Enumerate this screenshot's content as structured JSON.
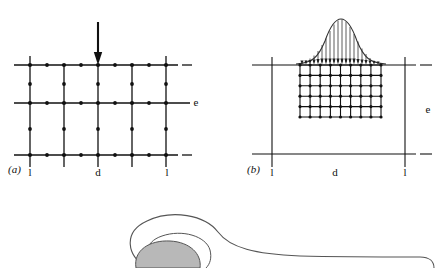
{
  "figure": {
    "caption_panels": [
      "(a)",
      "(b)"
    ],
    "background_color": "#ffffff",
    "line_color": "#111111",
    "node_color": "#111111",
    "fill_gray": "#b8b8b8"
  },
  "panel_a": {
    "label": "(a)",
    "label_x": 8,
    "label_y": 173,
    "dim_width_label": "d",
    "dim_depth_label": "e",
    "tick_left_label": "l",
    "tick_right_label": "l",
    "dim_width_x": 98,
    "dim_width_y": 176,
    "dim_depth_x": 196,
    "dim_depth_y": 106,
    "tick_left_x": 30,
    "tick_left_y": 176,
    "tick_right_x": 167,
    "tick_right_y": 176,
    "grid": {
      "x_lines": [
        30,
        64,
        98,
        132,
        166
      ],
      "y_lines": [
        65,
        103,
        155
      ],
      "x_start": 14,
      "x_end": 178,
      "y_start": 56,
      "y_end": 167,
      "dashes_right": [
        {
          "x1": 182,
          "x2": 192,
          "y": 65
        },
        {
          "x1": 182,
          "x2": 192,
          "y": 155
        }
      ],
      "node_radius": 1.9,
      "line_width": 1.3
    },
    "load": {
      "type": "point-load-arrow",
      "x": 98,
      "y_top": 22,
      "y_bottom": 64,
      "head_width": 7,
      "head_length": 11
    }
  },
  "panel_b": {
    "label": "(b)",
    "label_x": 247,
    "label_y": 173,
    "dim_width_label": "d",
    "dim_depth_label": "e",
    "tick_left_label": "l",
    "tick_right_label": "l",
    "dim_width_x": 335,
    "dim_width_y": 176,
    "dim_depth_x": 428,
    "dim_depth_y": 113,
    "tick_left_x": 272,
    "tick_left_y": 176,
    "tick_right_x": 405,
    "tick_right_y": 176,
    "frame": {
      "top_y": 65,
      "bottom_y": 154,
      "x_start": 252,
      "x_end": 416,
      "left_x": 272,
      "right_x": 405,
      "vert_top": 57,
      "vert_bottom": 167,
      "dashes_right": [
        {
          "x1": 420,
          "x2": 432,
          "y": 65
        },
        {
          "x1": 420,
          "x2": 432,
          "y": 154
        }
      ]
    },
    "mesh": {
      "x_left": 300,
      "x_right": 381,
      "y_top": 65,
      "y_bottom": 117,
      "n_cols": 8,
      "n_rows": 5,
      "node_radius": 1.5,
      "line_width": 1.1
    },
    "load": {
      "type": "distributed-bell-curve",
      "curve_label": "gaussian",
      "peak_x": 341,
      "peak_y": 19,
      "baseline_y": 64,
      "left_x": 300,
      "right_x": 381,
      "sigma": 15,
      "n_arrows": 17,
      "arrow_head_width": 3.4,
      "arrow_head_length": 5
    }
  },
  "bottom_figure": {
    "description": "partial-cutoff-shape",
    "outline_color": "#444444",
    "circle_fill": "#b8b8b8",
    "circle_cx": 168,
    "circle_cy": 276,
    "circle_rx": 40,
    "circle_ry": 32
  }
}
